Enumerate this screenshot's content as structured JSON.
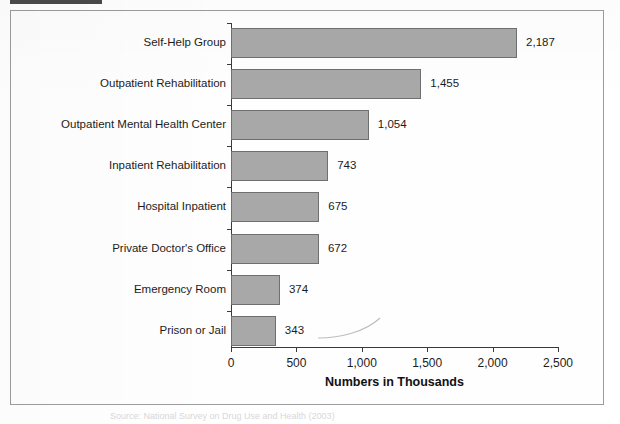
{
  "page": {
    "caption": "Source: National Survey on Drug Use and Health (2003)",
    "top_marker_name": "scan-edge-marker"
  },
  "chart_data": {
    "type": "bar",
    "orientation": "horizontal",
    "title": "",
    "xlabel": "Numbers in Thousands",
    "ylabel": "",
    "categories": [
      "Self-Help Group",
      "Outpatient Rehabilitation",
      "Outpatient Mental Health Center",
      "Inpatient Rehabilitation",
      "Hospital Inpatient",
      "Private Doctor's Office",
      "Emergency Room",
      "Prison or Jail"
    ],
    "values": [
      2187,
      1455,
      1054,
      743,
      675,
      672,
      374,
      343
    ],
    "value_labels": [
      "2,187",
      "1,455",
      "1,054",
      "743",
      "675",
      "672",
      "374",
      "343"
    ],
    "xlim": [
      0,
      2500
    ],
    "xticks": [
      0,
      500,
      1000,
      1500,
      2000,
      2500
    ],
    "xtick_labels": [
      "0",
      "500",
      "1,000",
      "1,500",
      "2,000",
      "2,500"
    ],
    "grid": false,
    "legend": false,
    "bar_fill_color": "#a8a8a8",
    "bar_border_color": "#6f6f6f",
    "axis_color": "#3a3a3a",
    "frame_color": "#9c9c9c"
  }
}
